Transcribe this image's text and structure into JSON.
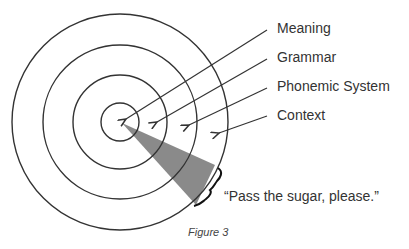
{
  "diagram": {
    "labels": [
      {
        "id": "meaning",
        "text": "Meaning"
      },
      {
        "id": "grammar",
        "text": "Grammar"
      },
      {
        "id": "phonemic",
        "text": "Phonemic System"
      },
      {
        "id": "context",
        "text": "Context"
      }
    ],
    "quote": "“Pass the sugar, please.”",
    "caption": "Figure 3",
    "rings": 4,
    "colors": {
      "stroke": "#333333",
      "wedge": "#8a8a8a",
      "text": "#333333",
      "background": "#ffffff"
    }
  }
}
